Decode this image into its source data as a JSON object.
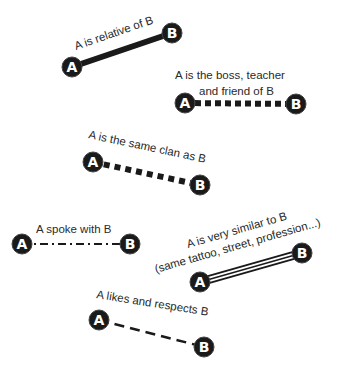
{
  "diagram": {
    "node_labels": {
      "a": "A",
      "b": "B"
    },
    "relations": [
      {
        "id": "relative",
        "label": "A is relative of B",
        "line_style": "thick-solid",
        "a": [
          72,
          67
        ],
        "b": [
          172,
          33
        ]
      },
      {
        "id": "boss",
        "label_line1": "A is the boss, teacher",
        "label_line2": "and friend of B",
        "line_style": "square-dotted",
        "a": [
          185,
          103
        ],
        "b": [
          296,
          104
        ]
      },
      {
        "id": "clan",
        "label": "A is the same clan as B",
        "line_style": "square-dotted",
        "a": [
          93,
          162
        ],
        "b": [
          200,
          185
        ]
      },
      {
        "id": "spoke",
        "label": "A spoke with B",
        "line_style": "dash-dot",
        "a": [
          22,
          244
        ],
        "b": [
          130,
          244
        ]
      },
      {
        "id": "similar",
        "label_line1": "A is very similar to B",
        "label_line2": "(same tattoo, street, profession...)",
        "line_style": "triple-line",
        "a": [
          200,
          282
        ],
        "b": [
          302,
          253
        ]
      },
      {
        "id": "likes",
        "label": "A likes and respects B",
        "line_style": "dashed",
        "a": [
          99,
          320
        ],
        "b": [
          204,
          347
        ]
      }
    ],
    "colors": {
      "line": "#1a1a1a",
      "node_fill": "#1a1a1a",
      "node_text": "#ffffff",
      "label": "#2a2a2a",
      "background": "#ffffff"
    }
  }
}
